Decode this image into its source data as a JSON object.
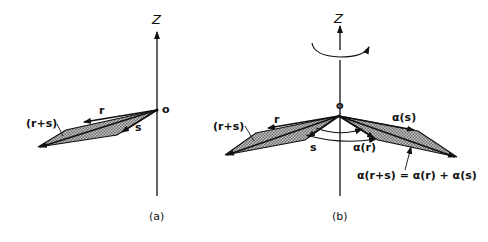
{
  "panel_a": {
    "caption": "(a)",
    "axis_label": "Z",
    "origin_label": "o",
    "vector_r": "r",
    "vector_s": "s",
    "sum_label": "(r+s)"
  },
  "panel_b": {
    "caption": "(b)",
    "axis_label": "Z",
    "origin_label": "o",
    "vector_r": "r",
    "vector_s": "s",
    "sum_label": "(r+s)",
    "rot_s": "α(s)",
    "rot_r": "α(r)",
    "equation": "α(r+s) = α(r) + α(s)"
  },
  "colors": {
    "ink": "#111111",
    "hatch": "#9a9a9a",
    "background": "#ffffff"
  }
}
